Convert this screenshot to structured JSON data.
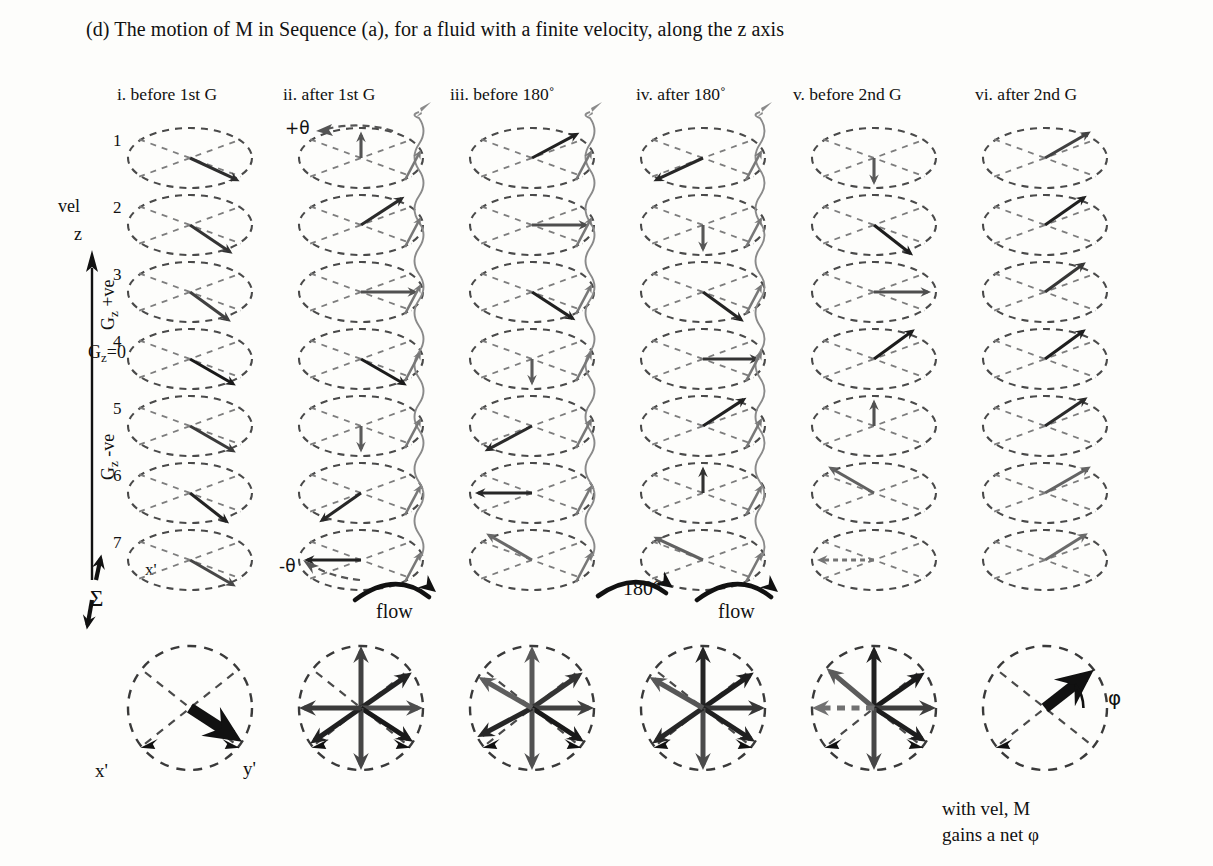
{
  "figure": {
    "title": "(d) The motion of M in Sequence (a), for a fluid with a finite velocity, along the z axis",
    "column_headers": [
      "i. before 1st G",
      "ii. after 1st G",
      "iii. before 180˚",
      "iv. after 180˚",
      "v. before 2nd G",
      "vi. after 2nd G"
    ],
    "row_numbers": [
      "1",
      "2",
      "3",
      "4",
      "5",
      "6",
      "7"
    ],
    "axis": {
      "vel_label": "vel",
      "z_label": "z",
      "gz_positive": "+ve",
      "gz_zero": "=0",
      "gz_negative": "-ve",
      "gz_symbol": "G",
      "gz_subscript": "z"
    },
    "annotations": {
      "theta_plus": "+θ",
      "theta_minus": "-θ",
      "flow_1": "flow",
      "flow_2": "flow",
      "rotation_180": "180°",
      "sigma": "Σ",
      "xprime_grid": "x'",
      "xprime_sum": "x'",
      "yprime_sum": "y'",
      "phi": "φ"
    },
    "caption": {
      "line1": "with vel, M",
      "line2": "gains a net φ"
    },
    "colors": {
      "ink": "#111111",
      "dash_gray": "#555555",
      "mid_gray": "#6d6d6d",
      "light_gray": "#a8a8a8",
      "paper": "#fdfdfb"
    }
  },
  "chart_data": {
    "type": "diagram",
    "title": "(d) The motion of M in Sequence (a), for a fluid with a finite velocity, along the z axis",
    "grid": {
      "columns": 6,
      "rows": 7,
      "cell_origin_x": 190,
      "cell_origin_y": 158,
      "cell_dx": 171,
      "cell_dy": 67,
      "ellipse_rx": 62,
      "ellipse_ry": 30
    },
    "note": "angle in degrees measured CCW from +x axis (screen); len is fraction of rx; shade 0=black 1=light",
    "vectors": [
      [
        {
          "angle": -25,
          "len": 0.95,
          "shade": 0.18
        },
        {
          "angle": 90,
          "len": 0.88,
          "shade": 0.42
        },
        {
          "angle": 28,
          "len": 0.95,
          "shade": 0.1
        },
        {
          "angle": 205,
          "len": 0.95,
          "shade": 0.14
        },
        {
          "angle": -90,
          "len": 0.9,
          "shade": 0.45
        },
        {
          "angle": 30,
          "len": 0.95,
          "shade": 0.3
        }
      ],
      [
        {
          "angle": -34,
          "len": 0.95,
          "shade": 0.22
        },
        {
          "angle": 33,
          "len": 0.95,
          "shade": 0.16
        },
        {
          "angle": 0,
          "len": 0.92,
          "shade": 0.38
        },
        {
          "angle": -90,
          "len": 0.9,
          "shade": 0.44
        },
        {
          "angle": -38,
          "len": 0.95,
          "shade": 0.08
        },
        {
          "angle": 35,
          "len": 0.95,
          "shade": 0.1
        }
      ],
      [
        {
          "angle": -36,
          "len": 0.95,
          "shade": 0.3
        },
        {
          "angle": 0,
          "len": 0.92,
          "shade": 0.4
        },
        {
          "angle": -33,
          "len": 0.95,
          "shade": 0.1
        },
        {
          "angle": -36,
          "len": 0.95,
          "shade": 0.12
        },
        {
          "angle": 0,
          "len": 0.92,
          "shade": 0.38
        },
        {
          "angle": 36,
          "len": 0.95,
          "shade": 0.24
        }
      ],
      [
        {
          "angle": -30,
          "len": 0.95,
          "shade": 0.05
        },
        {
          "angle": -30,
          "len": 0.95,
          "shade": 0.06
        },
        {
          "angle": -90,
          "len": 0.88,
          "shade": 0.46
        },
        {
          "angle": 0,
          "len": 0.92,
          "shade": 0.22
        },
        {
          "angle": 36,
          "len": 0.95,
          "shade": 0.06
        },
        {
          "angle": 36,
          "len": 0.95,
          "shade": 0.08
        }
      ],
      [
        {
          "angle": -30,
          "len": 0.95,
          "shade": 0.26
        },
        {
          "angle": -90,
          "len": 0.88,
          "shade": 0.46
        },
        {
          "angle": 208,
          "len": 0.95,
          "shade": 0.16
        },
        {
          "angle": 33,
          "len": 0.95,
          "shade": 0.1
        },
        {
          "angle": 90,
          "len": 0.88,
          "shade": 0.4
        },
        {
          "angle": 34,
          "len": 0.95,
          "shade": 0.16
        }
      ],
      [
        {
          "angle": -38,
          "len": 0.95,
          "shade": 0.12
        },
        {
          "angle": 215,
          "len": 0.95,
          "shade": 0.14
        },
        {
          "angle": 180,
          "len": 0.92,
          "shade": 0.14
        },
        {
          "angle": 90,
          "len": 0.88,
          "shade": 0.2
        },
        {
          "angle": 150,
          "len": 0.95,
          "shade": 0.5
        },
        {
          "angle": 30,
          "len": 0.95,
          "shade": 0.52
        }
      ],
      [
        {
          "angle": -30,
          "len": 0.95,
          "shade": 0.34
        },
        {
          "angle": 180,
          "len": 0.92,
          "shade": 0.1
        },
        {
          "angle": 150,
          "len": 0.95,
          "shade": 0.55
        },
        {
          "angle": 155,
          "len": 0.95,
          "shade": 0.5
        },
        {
          "angle": 180,
          "len": 0.92,
          "shade": 0.62,
          "dashed": true
        },
        {
          "angle": 32,
          "len": 0.92,
          "shade": 0.56
        }
      ]
    ],
    "summation": {
      "origin_x": 190,
      "origin_y": 708,
      "dx": 171,
      "radius": 62,
      "circles": [
        {
          "arrows": [
            {
              "angle": -33,
              "len": 1.0,
              "shade": 0.0,
              "width": 11
            }
          ]
        },
        {
          "arrows": [
            {
              "angle": 90,
              "len": 1.0,
              "shade": 0.3,
              "width": 5
            },
            {
              "angle": 35,
              "len": 1.0,
              "shade": 0.12,
              "width": 5
            },
            {
              "angle": 0,
              "len": 1.0,
              "shade": 0.38,
              "width": 5
            },
            {
              "angle": -33,
              "len": 1.0,
              "shade": 0.05,
              "width": 5
            },
            {
              "angle": -90,
              "len": 1.0,
              "shade": 0.33,
              "width": 5
            },
            {
              "angle": 215,
              "len": 1.0,
              "shade": 0.1,
              "width": 5
            },
            {
              "angle": 180,
              "len": 1.0,
              "shade": 0.26,
              "width": 5
            }
          ]
        },
        {
          "arrows": [
            {
              "angle": 90,
              "len": 1.0,
              "shade": 0.45,
              "width": 5
            },
            {
              "angle": 35,
              "len": 1.0,
              "shade": 0.22,
              "width": 5
            },
            {
              "angle": 0,
              "len": 1.0,
              "shade": 0.3,
              "width": 5
            },
            {
              "angle": -33,
              "len": 1.0,
              "shade": 0.05,
              "width": 5
            },
            {
              "angle": -90,
              "len": 1.0,
              "shade": 0.4,
              "width": 5
            },
            {
              "angle": 208,
              "len": 1.0,
              "shade": 0.14,
              "width": 5
            },
            {
              "angle": 150,
              "len": 1.0,
              "shade": 0.48,
              "width": 5
            }
          ]
        },
        {
          "arrows": [
            {
              "angle": 90,
              "len": 1.0,
              "shade": 0.12,
              "width": 5
            },
            {
              "angle": 35,
              "len": 1.0,
              "shade": 0.08,
              "width": 5
            },
            {
              "angle": 0,
              "len": 1.0,
              "shade": 0.24,
              "width": 5
            },
            {
              "angle": -33,
              "len": 1.0,
              "shade": 0.1,
              "width": 5
            },
            {
              "angle": -90,
              "len": 1.0,
              "shade": 0.36,
              "width": 5
            },
            {
              "angle": 215,
              "len": 1.0,
              "shade": 0.14,
              "width": 5
            },
            {
              "angle": 150,
              "len": 1.0,
              "shade": 0.44,
              "width": 5
            }
          ]
        },
        {
          "arrows": [
            {
              "angle": 90,
              "len": 1.0,
              "shade": 0.1,
              "width": 5
            },
            {
              "angle": 35,
              "len": 1.0,
              "shade": 0.06,
              "width": 5
            },
            {
              "angle": 0,
              "len": 1.0,
              "shade": 0.28,
              "width": 5
            },
            {
              "angle": -33,
              "len": 1.0,
              "shade": 0.08,
              "width": 5
            },
            {
              "angle": -90,
              "len": 1.0,
              "shade": 0.34,
              "width": 5
            },
            {
              "angle": 140,
              "len": 1.0,
              "shade": 0.46,
              "width": 5
            },
            {
              "angle": 180,
              "len": 1.0,
              "shade": 0.6,
              "width": 5,
              "dashed": true
            }
          ]
        },
        {
          "arrows": [
            {
              "angle": 38,
              "len": 1.0,
              "shade": 0.0,
              "width": 11
            }
          ]
        }
      ]
    }
  }
}
